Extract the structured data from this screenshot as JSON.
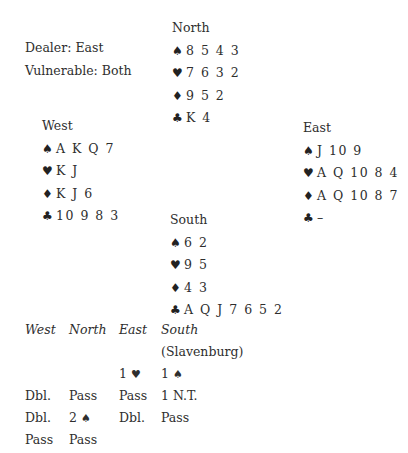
{
  "deal_info": {
    "dealer": "Dealer: East",
    "vulnerable": "Vulnerable: Both"
  },
  "suit_icons": {
    "spades": "♠",
    "hearts": "♥",
    "diamonds": "♦",
    "clubs": "♣"
  },
  "hands": {
    "north": {
      "name": "North",
      "spades": "8 5 4 3",
      "hearts": "7 6 3 2",
      "diamonds": "9 5 2",
      "clubs": "K 4"
    },
    "west": {
      "name": "West",
      "spades": "A K Q 7",
      "hearts": "K J",
      "diamonds": "K J 6",
      "clubs": "10 9 8 3"
    },
    "east": {
      "name": "East",
      "spades": "J 10 9",
      "hearts": "A Q 10 8 4",
      "diamonds": "A Q 10 8 7",
      "clubs": "–"
    },
    "south": {
      "name": "South",
      "spades": "6 2",
      "hearts": "9 5",
      "diamonds": "4 3",
      "clubs": "A Q J 7 6 5 2"
    }
  },
  "auction": {
    "headers": [
      "West",
      "North",
      "East",
      "South"
    ],
    "south_player": "(Slavenburg)",
    "rows": [
      [
        "",
        "",
        "1",
        "1"
      ],
      [
        "Dbl.",
        "Pass",
        "Pass",
        "1 N.T."
      ],
      [
        "Dbl.",
        "2",
        "Dbl.",
        "Pass"
      ],
      [
        "Pass",
        "Pass",
        "",
        ""
      ]
    ],
    "bid_suits": {
      "row0_east": "♥",
      "row0_south": "♠",
      "row2_north": "♠"
    }
  }
}
